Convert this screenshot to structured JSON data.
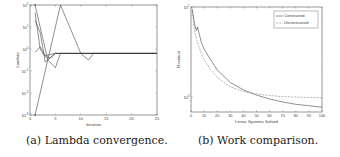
{
  "chart_data": [
    {
      "type": "line",
      "title": "",
      "xlabel": "Iteration",
      "ylabel": "Lambda",
      "xlim": [
        0,
        25
      ],
      "yscale": "log",
      "ytick_labels": [
        "10^-3",
        "10^-2",
        "10^-1",
        "10^0",
        "10^1",
        "10^2"
      ],
      "xtick_labels": [
        "0",
        "5",
        "10",
        "15",
        "20",
        "25"
      ],
      "grid": false,
      "legend": null,
      "caption": "(a) Lambda convergence.",
      "series": [
        {
          "name": "lambda 1",
          "x": [
            1,
            6,
            8,
            10,
            11.5,
            12.5,
            25
          ],
          "y_rel": [
            0.0,
            1.0,
            0.78,
            0.56,
            0.5,
            0.56,
            0.56
          ]
        },
        {
          "name": "lambda 2",
          "x": [
            1,
            3.5,
            5,
            6,
            25
          ],
          "y_rel": [
            1.0,
            0.5,
            0.43,
            0.56,
            0.56
          ]
        },
        {
          "name": "lambda 3",
          "x": [
            1,
            2,
            3,
            5,
            25
          ],
          "y_rel": [
            0.86,
            0.75,
            0.48,
            0.56,
            0.56
          ]
        },
        {
          "name": "lambda 4",
          "x": [
            1,
            2,
            3,
            4,
            5,
            25
          ],
          "y_rel": [
            0.93,
            0.6,
            0.53,
            0.52,
            0.56,
            0.56
          ]
        },
        {
          "name": "lambda 5",
          "x": [
            1,
            2,
            3,
            5,
            25
          ],
          "y_rel": [
            0.57,
            0.62,
            0.54,
            0.56,
            0.56
          ]
        }
      ]
    },
    {
      "type": "line",
      "title": "",
      "xlabel": "Linear Systems Solved",
      "ylabel": "Residual",
      "xlim": [
        0,
        100
      ],
      "yscale": "log",
      "ytick_labels": [
        "10^0",
        "10^1"
      ],
      "xtick_labels": [
        "0",
        "10",
        "20",
        "30",
        "40",
        "50",
        "60",
        "70",
        "80",
        "90",
        "100"
      ],
      "grid": false,
      "legend": {
        "position": "upper right",
        "entries": [
          "Constrained",
          "Unconstrained"
        ]
      },
      "caption": "(b) Work comparison.",
      "series": [
        {
          "name": "Constrained",
          "style": "solid",
          "x": [
            1,
            2,
            3,
            4,
            5,
            6,
            8,
            10,
            15,
            20,
            30,
            40,
            50,
            60,
            70,
            80,
            90,
            100
          ],
          "y": [
            9.5,
            7.5,
            6.2,
            5.5,
            6.0,
            5.2,
            4.0,
            3.4,
            2.6,
            2.0,
            1.45,
            1.2,
            1.05,
            0.95,
            0.88,
            0.83,
            0.8,
            0.77
          ]
        },
        {
          "name": "Unconstrained",
          "style": "dashed",
          "x": [
            1,
            2,
            3,
            5,
            8,
            10,
            15,
            20,
            30,
            40,
            50,
            60,
            70,
            80,
            90,
            100
          ],
          "y": [
            9.0,
            6.5,
            5.2,
            4.0,
            3.0,
            2.6,
            2.0,
            1.65,
            1.3,
            1.15,
            1.08,
            1.04,
            1.01,
            1.0,
            0.99,
            0.98
          ]
        }
      ]
    }
  ],
  "captions": {
    "a": "(a) Lambda convergence.",
    "b": "(b) Work comparison."
  },
  "axes": {
    "a": {
      "xlabel": "Iteration",
      "ylabel": "Lambda"
    },
    "b": {
      "xlabel": "Linear Systems Solved",
      "ylabel": "Residual"
    }
  },
  "legend": {
    "constrained": "Constrained",
    "unconstrained": "Unconstrained"
  }
}
